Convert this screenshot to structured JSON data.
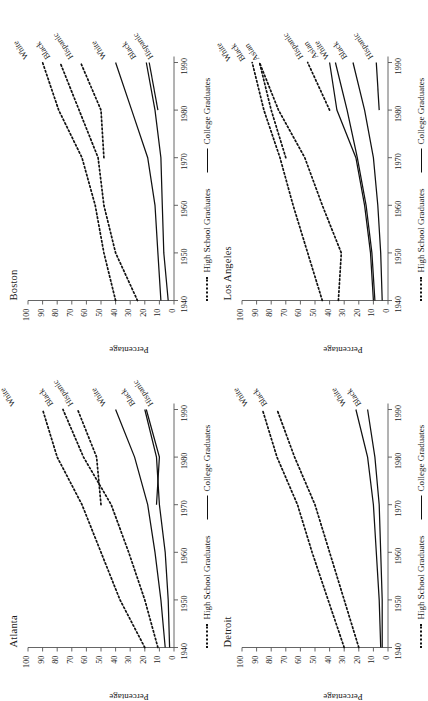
{
  "figure": {
    "axis_title_y": "Percentage",
    "legend": [
      {
        "label": "High School Graduates",
        "style": "dashed"
      },
      {
        "label": "College Graduates",
        "style": "solid"
      }
    ],
    "y_ticks": [
      "0",
      "10",
      "20",
      "30",
      "40",
      "50",
      "60",
      "70",
      "80",
      "90",
      "100"
    ],
    "x_ticks": [
      "1940",
      "1950",
      "1960",
      "1970",
      "1980",
      "1990"
    ]
  },
  "chart_data": [
    {
      "type": "line",
      "title": "Atlanta",
      "xlabel": "",
      "ylabel": "Percentage",
      "ylim": [
        0,
        100
      ],
      "xlim": [
        1940,
        1990
      ],
      "grid": false,
      "legend_position": "bottom",
      "x": [
        1940,
        1950,
        1960,
        1970,
        1980,
        1990
      ],
      "series": [
        {
          "name": "White",
          "group": "High School Graduates",
          "style": "dashed",
          "values": [
            20,
            37,
            50,
            63,
            80,
            90
          ]
        },
        {
          "name": "Black",
          "group": "High School Graduates",
          "style": "dashed",
          "values": [
            11,
            20,
            31,
            43,
            62,
            76
          ]
        },
        {
          "name": "Hispanic",
          "group": "High School Graduates",
          "style": "dashed",
          "values": [
            null,
            null,
            null,
            50,
            53,
            66
          ]
        },
        {
          "name": "White",
          "group": "College Graduates",
          "style": "solid",
          "values": [
            6,
            9,
            13,
            18,
            27,
            40
          ]
        },
        {
          "name": "Black",
          "group": "College Graduates",
          "style": "solid",
          "values": [
            3,
            4,
            6,
            10,
            12,
            20
          ]
        },
        {
          "name": "Hispanic",
          "group": "College Graduates",
          "style": "solid",
          "values": [
            null,
            null,
            null,
            12,
            10,
            19
          ]
        }
      ]
    },
    {
      "type": "line",
      "title": "Boston",
      "xlabel": "",
      "ylabel": "Percentage",
      "ylim": [
        0,
        100
      ],
      "xlim": [
        1940,
        1990
      ],
      "grid": false,
      "legend_position": "bottom",
      "x": [
        1940,
        1950,
        1960,
        1970,
        1980,
        1990
      ],
      "series": [
        {
          "name": "White",
          "group": "High School Graduates",
          "style": "dashed",
          "values": [
            40,
            48,
            54,
            63,
            79,
            90
          ]
        },
        {
          "name": "Black",
          "group": "High School Graduates",
          "style": "dashed",
          "values": [
            25,
            40,
            48,
            52,
            65,
            78
          ]
        },
        {
          "name": "Hispanic",
          "group": "High School Graduates",
          "style": "dashed",
          "values": [
            null,
            null,
            null,
            48,
            50,
            64
          ]
        },
        {
          "name": "White",
          "group": "College Graduates",
          "style": "solid",
          "values": [
            9,
            11,
            13,
            18,
            29,
            40
          ]
        },
        {
          "name": "Black",
          "group": "College Graduates",
          "style": "solid",
          "values": [
            4,
            7,
            8,
            9,
            13,
            19
          ]
        },
        {
          "name": "Hispanic",
          "group": "College Graduates",
          "style": "solid",
          "values": [
            null,
            null,
            null,
            null,
            11,
            17
          ]
        }
      ]
    },
    {
      "type": "line",
      "title": "Detroit",
      "xlabel": "",
      "ylabel": "Percentage",
      "ylim": [
        0,
        100
      ],
      "xlim": [
        1940,
        1990
      ],
      "grid": false,
      "legend_position": "bottom",
      "x": [
        1940,
        1950,
        1960,
        1970,
        1980,
        1990
      ],
      "series": [
        {
          "name": "White",
          "group": "High School Graduates",
          "style": "dashed",
          "values": [
            30,
            41,
            52,
            62,
            76,
            86
          ]
        },
        {
          "name": "Black",
          "group": "High School Graduates",
          "style": "dashed",
          "values": [
            20,
            30,
            40,
            50,
            64,
            76
          ]
        },
        {
          "name": "White",
          "group": "College Graduates",
          "style": "solid",
          "values": [
            5,
            6,
            8,
            10,
            14,
            22
          ]
        },
        {
          "name": "Black",
          "group": "College Graduates",
          "style": "solid",
          "values": [
            4,
            4,
            5,
            6,
            9,
            14
          ]
        }
      ]
    },
    {
      "type": "line",
      "title": "Los Angeles",
      "xlabel": "",
      "ylabel": "Percentage",
      "ylim": [
        0,
        100
      ],
      "xlim": [
        1940,
        1990
      ],
      "grid": false,
      "legend_position": "bottom",
      "x": [
        1940,
        1950,
        1960,
        1970,
        1980,
        1990
      ],
      "series": [
        {
          "name": "White",
          "group": "High School Graduates",
          "style": "dashed",
          "values": [
            45,
            55,
            65,
            74,
            85,
            93
          ]
        },
        {
          "name": "Black",
          "group": "High School Graduates",
          "style": "dashed",
          "values": [
            34,
            32,
            45,
            57,
            75,
            88
          ]
        },
        {
          "name": "Asian",
          "group": "High School Graduates",
          "style": "dashed",
          "values": [
            null,
            null,
            null,
            70,
            80,
            88
          ]
        },
        {
          "name": "Hispanic",
          "group": "High School Graduates",
          "style": "dashed",
          "values": [
            null,
            null,
            null,
            null,
            40,
            55
          ]
        },
        {
          "name": "Asian",
          "group": "College Graduates",
          "style": "solid",
          "values": [
            10,
            12,
            16,
            22,
            35,
            40
          ]
        },
        {
          "name": "White",
          "group": "College Graduates",
          "style": "solid",
          "values": [
            9,
            11,
            15,
            21,
            28,
            36
          ]
        },
        {
          "name": "Black",
          "group": "College Graduates",
          "style": "solid",
          "values": [
            4,
            5,
            7,
            10,
            16,
            24
          ]
        },
        {
          "name": "Hispanic",
          "group": "College Graduates",
          "style": "solid",
          "values": [
            null,
            null,
            null,
            null,
            6,
            8
          ]
        }
      ]
    }
  ],
  "panels": [
    {
      "key": "atlanta",
      "title": "Atlanta",
      "labels_hs": [
        {
          "text": "White",
          "x": 1990,
          "y": 98,
          "angle": -34,
          "dx": 4,
          "dy": -16
        },
        {
          "text": "Black",
          "x": 1990,
          "y": 80,
          "angle": -34,
          "dx": 4,
          "dy": -4
        },
        {
          "text": "Hispanic",
          "x": 1990,
          "y": 68,
          "angle": -34,
          "dx": 4,
          "dy": -2
        }
      ],
      "labels_cg": [
        {
          "text": "White",
          "x": 1990,
          "y": 44,
          "angle": -34,
          "dx": 4,
          "dy": -4
        },
        {
          "text": "Black",
          "x": 1990,
          "y": 24,
          "angle": -34,
          "dx": 4,
          "dy": -4
        },
        {
          "text": "Hispanic",
          "x": 1990,
          "y": 16,
          "angle": -34,
          "dx": 4,
          "dy": 2
        }
      ]
    },
    {
      "key": "boston",
      "title": "Boston",
      "labels_hs": [
        {
          "text": "White",
          "x": 1990,
          "y": 96,
          "angle": -34,
          "dx": 4,
          "dy": -6
        },
        {
          "text": "Black",
          "x": 1990,
          "y": 82,
          "angle": -34,
          "dx": 4,
          "dy": -4
        },
        {
          "text": "Hispanic",
          "x": 1990,
          "y": 68,
          "angle": -34,
          "dx": 4,
          "dy": -2
        }
      ],
      "labels_cg": [
        {
          "text": "White",
          "x": 1990,
          "y": 44,
          "angle": -34,
          "dx": 4,
          "dy": -4
        },
        {
          "text": "Black",
          "x": 1990,
          "y": 23,
          "angle": -34,
          "dx": 4,
          "dy": -4
        },
        {
          "text": "Hispanic",
          "x": 1990,
          "y": 15,
          "angle": -34,
          "dx": 4,
          "dy": 1
        }
      ]
    },
    {
      "key": "detroit",
      "title": "Detroit",
      "labels_hs": [
        {
          "text": "White",
          "x": 1990,
          "y": 92,
          "angle": -34,
          "dx": 4,
          "dy": -6
        },
        {
          "text": "Black",
          "x": 1990,
          "y": 80,
          "angle": -34,
          "dx": 4,
          "dy": -4
        }
      ],
      "labels_cg": [
        {
          "text": "White",
          "x": 1990,
          "y": 26,
          "angle": -34,
          "dx": 4,
          "dy": -4
        },
        {
          "text": "Black",
          "x": 1990,
          "y": 17,
          "angle": -34,
          "dx": 4,
          "dy": -2
        }
      ]
    },
    {
      "key": "la",
      "title": "Los Angeles",
      "labels_hs": [
        {
          "text": "White",
          "x": 1990,
          "y": 101,
          "angle": -34,
          "dx": 2,
          "dy": -10
        },
        {
          "text": "Black",
          "x": 1990,
          "y": 95,
          "angle": -34,
          "dx": 2,
          "dy": -4
        },
        {
          "text": "Asian",
          "x": 1990,
          "y": 89,
          "angle": -34,
          "dx": 2,
          "dy": 1
        },
        {
          "text": "Hispanic",
          "x": 1990,
          "y": 58,
          "angle": -34,
          "dx": 4,
          "dy": 0
        }
      ],
      "labels_cg": [
        {
          "text": "Asian",
          "x": 1990,
          "y": 44,
          "angle": -34,
          "dx": 4,
          "dy": -6
        },
        {
          "text": "White",
          "x": 1990,
          "y": 39,
          "angle": -34,
          "dx": 4,
          "dy": -2
        },
        {
          "text": "Black",
          "x": 1990,
          "y": 27,
          "angle": -34,
          "dx": 4,
          "dy": -2
        },
        {
          "text": "Hispanic",
          "x": 1990,
          "y": 10,
          "angle": -34,
          "dx": 4,
          "dy": 0
        }
      ]
    }
  ]
}
